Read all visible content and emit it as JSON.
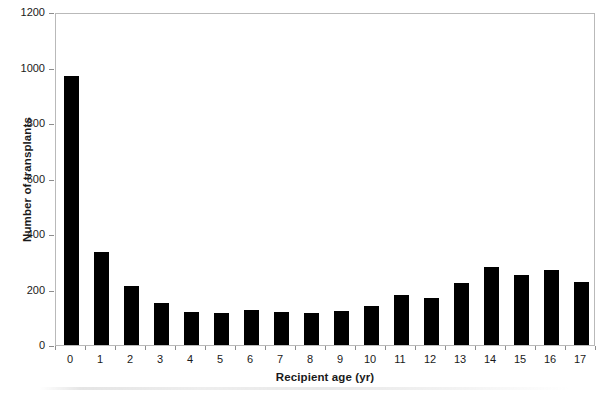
{
  "chart_data": {
    "type": "bar",
    "title": "",
    "xlabel": "Recipient age (yr)",
    "ylabel": "Number of transplants",
    "categories": [
      "0",
      "1",
      "2",
      "3",
      "4",
      "5",
      "6",
      "7",
      "8",
      "9",
      "10",
      "11",
      "12",
      "13",
      "14",
      "15",
      "16",
      "17"
    ],
    "values": [
      968,
      336,
      214,
      153,
      120,
      117,
      125,
      120,
      115,
      121,
      140,
      180,
      170,
      222,
      281,
      253,
      271,
      226
    ],
    "ylim": [
      0,
      1200
    ],
    "yticks": [
      0,
      200,
      400,
      600,
      800,
      1000,
      1200
    ],
    "ytick_labels": [
      "0",
      "200",
      "400",
      "600",
      "800",
      "1000",
      "1200"
    ],
    "grid": false,
    "legend": null,
    "bar_color": "#000000",
    "frame_color": "#b9b9b9",
    "background": "#ffffff"
  }
}
